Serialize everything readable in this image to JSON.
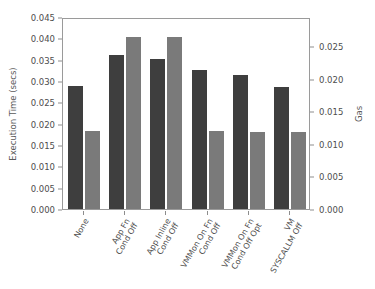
{
  "chart_data": {
    "type": "bar",
    "title": "",
    "xlabel": "",
    "ylabel": "Execution Time (secs)",
    "y2label": "Gas",
    "grid": false,
    "legend": "none",
    "categories": [
      "None",
      "App Fn\nCond Off",
      "App Inline\nCond Off",
      "VMMon On Fn\nCond Off",
      "VMMon On Fn\nCond Off Opt",
      "VM\nSYSCALLM Off"
    ],
    "category_lines": [
      [
        "None"
      ],
      [
        "App Fn",
        "Cond Off"
      ],
      [
        "App Inline",
        "Cond Off"
      ],
      [
        "VMMon On Fn",
        "Cond Off"
      ],
      [
        "VMMon On Fn",
        "Cond Off Opt"
      ],
      [
        "VM",
        "SYSCALLM Off"
      ]
    ],
    "series": [
      {
        "name": "Execution Time (secs)",
        "axis": "left",
        "color": "#3e3e3e",
        "values": [
          0.0288,
          0.036,
          0.0352,
          0.0325,
          0.0315,
          0.0287
        ]
      },
      {
        "name": "Gas",
        "axis": "right",
        "color": "#7a7a7a",
        "values": [
          0.012,
          0.0265,
          0.0265,
          0.012,
          0.0119,
          0.0119
        ]
      }
    ],
    "ylim": [
      0.0,
      0.045
    ],
    "y2lim": [
      0.0,
      0.0295
    ],
    "yticks": [
      0.0,
      0.005,
      0.01,
      0.015,
      0.02,
      0.025,
      0.03,
      0.035,
      0.04,
      0.045
    ],
    "ytick_labels": [
      "0.000",
      "0.005",
      "0.010",
      "0.015",
      "0.020",
      "0.025",
      "0.030",
      "0.035",
      "0.040",
      "0.045"
    ],
    "y2ticks": [
      0.0,
      0.005,
      0.01,
      0.015,
      0.02,
      0.025
    ],
    "y2tick_labels": [
      "0.000",
      "0.005",
      "0.010",
      "0.015",
      "0.020",
      "0.025"
    ]
  }
}
